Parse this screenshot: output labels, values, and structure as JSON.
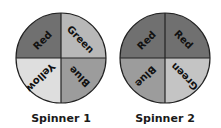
{
  "spinners": [
    {
      "caption": "Spinner 1",
      "sections": [
        {
          "position": "top-left",
          "label": "Red",
          "color": "#707070"
        },
        {
          "position": "top-right",
          "label": "Green",
          "color": "#b8b8b8"
        },
        {
          "position": "bottom-right",
          "label": "Blue",
          "color": "#9c9c9c"
        },
        {
          "position": "bottom-left",
          "label": "Yellow",
          "color": "#dedede"
        }
      ]
    },
    {
      "caption": "Spinner 2",
      "sections": [
        {
          "position": "top-left",
          "label": "Red",
          "color": "#707070"
        },
        {
          "position": "top-right",
          "label": "Red",
          "color": "#707070"
        },
        {
          "position": "bottom-right",
          "label": "Green",
          "color": "#c4c4c4"
        },
        {
          "position": "bottom-left",
          "label": "Blue",
          "color": "#9c9c9c"
        }
      ]
    }
  ]
}
